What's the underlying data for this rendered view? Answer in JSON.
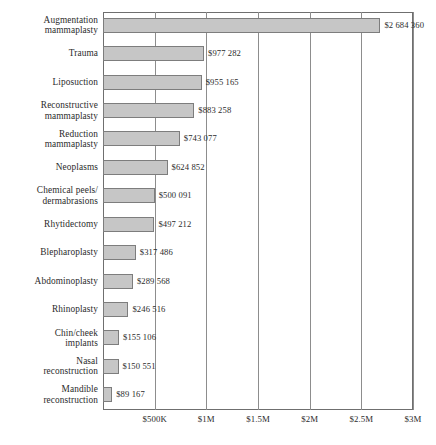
{
  "chart_data": {
    "type": "bar",
    "orientation": "horizontal",
    "title": "",
    "xlabel": "",
    "ylabel": "",
    "xlim": [
      0,
      3000000
    ],
    "grid": true,
    "legend": null,
    "xticks": [
      {
        "value": 500000,
        "label": "$500K"
      },
      {
        "value": 1000000,
        "label": "$1M"
      },
      {
        "value": 1500000,
        "label": "$1.5M"
      },
      {
        "value": 2000000,
        "label": "$2M"
      },
      {
        "value": 2500000,
        "label": "$2.5M"
      },
      {
        "value": 3000000,
        "label": "$3M"
      }
    ],
    "categories": [
      "Augmentation\nmammaplasty",
      "Trauma",
      "Liposuction",
      "Reconstructive\nmammaplasty",
      "Reduction\nmammaplasty",
      "Neoplasms",
      "Chemical peels/\ndermabrasions",
      "Rhytidectomy",
      "Blepharoplasty",
      "Abdominoplasty",
      "Rhinoplasty",
      "Chin/cheek\nimplants",
      "Nasal\nreconstruction",
      "Mandible\nreconstruction"
    ],
    "values": [
      2684360,
      977282,
      955165,
      883258,
      743077,
      624852,
      500091,
      497212,
      317486,
      289568,
      246516,
      155106,
      150551,
      89167
    ],
    "value_labels": [
      "$2 684 360",
      "$977 282",
      "$955 165",
      "$883 258",
      "$743 077",
      "$624 852",
      "$500 091",
      "$497 212",
      "$317 486",
      "$289 568",
      "$246 516",
      "$155 106",
      "$150 551",
      "$89 167"
    ],
    "colors": {
      "bar_fill": "#c6c6c6",
      "bar_stroke": "#7d7d7d",
      "gridline": "#8d8d8d",
      "axis": "#6f6f6f",
      "text": "#2b2b2b",
      "background": "#ffffff"
    }
  }
}
